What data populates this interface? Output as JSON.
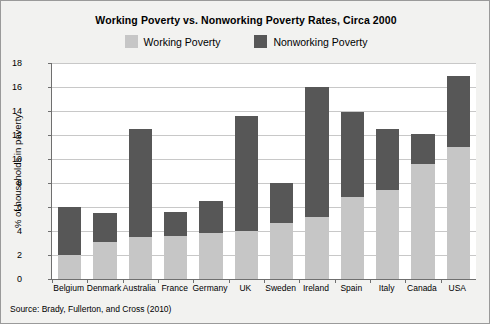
{
  "chart_data": {
    "type": "bar",
    "stacked": true,
    "title": "Working Poverty vs. Nonworking Poverty Rates, Circa 2000",
    "xlabel": "",
    "ylabel": "% of households in poverty",
    "ylim": [
      0,
      18
    ],
    "ytick_step": 2,
    "yticks": [
      0,
      2,
      4,
      6,
      8,
      10,
      12,
      14,
      16,
      18
    ],
    "grid": true,
    "legend_position": "top-center",
    "categories": [
      "Belgium",
      "Denmark",
      "Australia",
      "France",
      "Germany",
      "UK",
      "Sweden",
      "Ireland",
      "Spain",
      "Italy",
      "Canada",
      "USA"
    ],
    "series": [
      {
        "name": "Working Poverty",
        "color": "#c6c6c6",
        "values": [
          2.0,
          3.1,
          3.5,
          3.6,
          3.8,
          4.0,
          4.7,
          5.2,
          6.8,
          7.4,
          9.6,
          11.0
        ]
      },
      {
        "name": "Nonworking Poverty",
        "color": "#575757",
        "values": [
          4.0,
          2.4,
          9.0,
          2.0,
          2.7,
          9.6,
          3.3,
          10.8,
          7.1,
          5.1,
          2.5,
          5.9
        ]
      }
    ],
    "totals": [
      6.0,
      5.5,
      12.5,
      5.6,
      6.5,
      13.6,
      8.0,
      16.0,
      13.9,
      12.5,
      12.1,
      16.9
    ],
    "source": "Source: Brady, Fullerton, and Cross (2010)"
  },
  "legend": {
    "items": [
      {
        "label": "Working Poverty",
        "swatch": "#c6c6c6"
      },
      {
        "label": "Nonworking Poverty",
        "swatch": "#575757"
      }
    ]
  }
}
